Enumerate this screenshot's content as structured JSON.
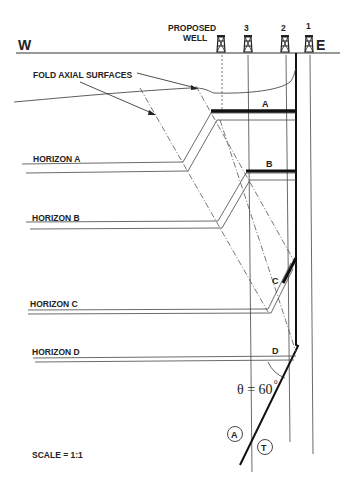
{
  "diagram": {
    "compass": {
      "west": "W",
      "east": "E"
    },
    "wells": [
      {
        "label": "PROPOSED",
        "label2": "WELL",
        "x": 221
      },
      {
        "label": "3",
        "x": 248
      },
      {
        "label": "2",
        "x": 285
      },
      {
        "label": "1",
        "x": 309
      }
    ],
    "annotation": "FOLD AXIAL SURFACES",
    "horizons": [
      {
        "label": "HORIZON A",
        "marker": "A"
      },
      {
        "label": "HORIZON B",
        "marker": "B"
      },
      {
        "label": "HORIZON C",
        "marker": "C"
      },
      {
        "label": "HORIZON D",
        "marker": "D"
      }
    ],
    "angle_label": "θ = 60",
    "angle_degree": "0",
    "circle_labels": {
      "left": "A",
      "right": "T"
    },
    "scale": "SCALE = 1:1"
  }
}
